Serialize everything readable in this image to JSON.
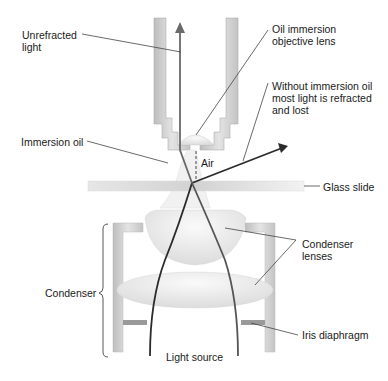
{
  "diagram": {
    "labels": {
      "unrefracted_light_1": "Unrefracted",
      "unrefracted_light_2": "light",
      "objective_lens_1": "Oil immersion",
      "objective_lens_2": "objective lens",
      "without_oil_1": "Without immersion oil",
      "without_oil_2": "most light is refracted",
      "without_oil_3": "and lost",
      "immersion_oil": "Immersion oil",
      "air": "Air",
      "glass_slide": "Glass slide",
      "condenser_lenses_1": "Condenser",
      "condenser_lenses_2": "lenses",
      "condenser": "Condenser",
      "iris_diaphragm": "Iris diaphragm",
      "light_source": "Light source"
    },
    "colors": {
      "housing": "#c8c8c8",
      "lens": "#ececec",
      "ray": "#333333",
      "ray_unrefracted": "#6a6a6a",
      "leader": "#444444"
    }
  }
}
